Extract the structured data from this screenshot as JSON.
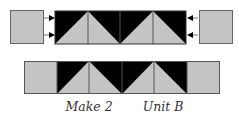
{
  "colors": {
    "gray": "#c4c4c4",
    "black": "#000000",
    "stroke": "#555555"
  },
  "caption": {
    "make": "Make 2",
    "unit": "Unit B"
  }
}
